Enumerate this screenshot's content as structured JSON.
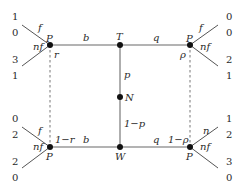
{
  "diagram": {
    "type": "game-tree",
    "nodes": {
      "T": {
        "label": "T",
        "x": 120,
        "y": 45
      },
      "N": {
        "label": "N",
        "x": 120,
        "y": 97
      },
      "W": {
        "label": "W",
        "x": 120,
        "y": 147
      },
      "P_tl": {
        "label": "P",
        "x": 50,
        "y": 45
      },
      "P_tr": {
        "label": "P",
        "x": 190,
        "y": 45
      },
      "P_bl": {
        "label": "P",
        "x": 50,
        "y": 147
      },
      "P_br": {
        "label": "P",
        "x": 190,
        "y": 147
      }
    },
    "edges": {
      "T_to_Ptl": "b",
      "T_to_Ptr": "q",
      "W_to_Pbl": "b",
      "W_to_Pbr": "q",
      "N_to_T": "p",
      "N_to_W": "1−p"
    },
    "beliefs": {
      "tl": "r",
      "bl": "1−r",
      "tr": "ρ",
      "br": "1−ρ"
    },
    "actions": {
      "tl_up": "f",
      "tl_down": "nf",
      "tr_up": "f",
      "tr_down": "nf",
      "bl_up": "f",
      "bl_down": "nf",
      "br_up": "n",
      "br_down": "nf"
    },
    "payoffs": {
      "tl_up": [
        "1",
        "0"
      ],
      "tl_down": [
        "3",
        "1"
      ],
      "tr_up": [
        "0",
        "0"
      ],
      "tr_down": [
        "2",
        "1"
      ],
      "bl_up": [
        "0",
        "2"
      ],
      "bl_down": [
        "2",
        "0"
      ],
      "br_up": [
        "1",
        "2"
      ],
      "br_down": [
        "3",
        "0"
      ]
    }
  }
}
